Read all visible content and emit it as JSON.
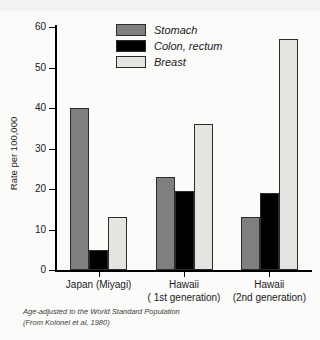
{
  "figure": {
    "clipped_title": "Cancer incidence in migrant populations",
    "ylabel": "Rate per 100,000",
    "footnote_line1": "Age-adjusted to the World Standard Population",
    "footnote_line2": "(From Kolonel et al, 1980)"
  },
  "colors": {
    "stomach": "#7f7f7f",
    "colon": "#000000",
    "breast": "#e4e4e1",
    "axis": "#000000",
    "background": "#fbfbfa"
  },
  "chart_data": {
    "type": "bar",
    "title": "",
    "xlabel": "",
    "ylabel": "Rate per 100,000",
    "ylim": [
      0,
      60
    ],
    "yticks": [
      0,
      10,
      20,
      30,
      40,
      50,
      60
    ],
    "ytick_labels": [
      "0",
      "10",
      "20",
      "30",
      "40",
      "50",
      "60"
    ],
    "grid": false,
    "legend_position": "top-center",
    "categories": [
      "Japan (Miyagi)",
      "Hawaii\n( 1st generation)",
      "Hawaii\n(2nd generation)"
    ],
    "category_labels": [
      "Japan (Miyagi)",
      "Hawaii ( 1st generation)",
      "Hawaii (2nd generation)"
    ],
    "series": [
      {
        "name": "Stomach",
        "color": "#7f7f7f",
        "values": [
          40,
          23,
          13
        ]
      },
      {
        "name": "Colon, rectum",
        "color": "#000000",
        "values": [
          5,
          19.5,
          19
        ]
      },
      {
        "name": "Breast",
        "color": "#e4e4e1",
        "values": [
          13,
          36,
          57
        ]
      }
    ],
    "annotations": [
      "Age-adjusted to the World Standard Population",
      "(From Kolonel et al, 1980)"
    ]
  }
}
